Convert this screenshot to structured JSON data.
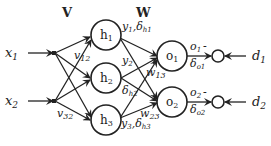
{
  "diagram": {
    "type": "neural-network-backprop",
    "layer_labels": {
      "input_to_hidden_weights": "V",
      "hidden_to_output_weights": "W"
    },
    "inputs": [
      {
        "id": "x1",
        "label": "x",
        "sub": "1"
      },
      {
        "id": "x2",
        "label": "x",
        "sub": "2"
      }
    ],
    "hidden_nodes": [
      {
        "id": "h1",
        "label": "h",
        "sub": "1"
      },
      {
        "id": "h2",
        "label": "h",
        "sub": "2"
      },
      {
        "id": "h3",
        "label": "h",
        "sub": "3"
      }
    ],
    "output_nodes": [
      {
        "id": "o1",
        "label": "o",
        "sub": "1"
      },
      {
        "id": "o2",
        "label": "o",
        "sub": "2"
      }
    ],
    "targets": [
      {
        "id": "d1",
        "label": "d",
        "sub": "1"
      },
      {
        "id": "d2",
        "label": "d",
        "sub": "2"
      }
    ],
    "edge_labels": {
      "v12": {
        "label": "v",
        "sub": "12"
      },
      "v32": {
        "label": "v",
        "sub": "32"
      },
      "w13": {
        "label": "w",
        "sub": "13"
      },
      "w23": {
        "label": "w",
        "sub": "23"
      }
    },
    "hidden_annotations": {
      "h1": {
        "y": "y",
        "ysub": "1",
        "delta": "δ",
        "dsub": "h1"
      },
      "h2": {
        "y": "y",
        "ysub": "2",
        "delta": "δ",
        "dsub": "h2"
      },
      "h3": {
        "y": "y",
        "ysub": "3",
        "delta": "δ",
        "dsub": "h3"
      }
    },
    "output_annotations": {
      "o1": {
        "o": "o",
        "osub": "1",
        "minus": "-",
        "delta": "δ",
        "dsub": "o1"
      },
      "o2": {
        "o": "o",
        "osub": "2",
        "minus": "-",
        "delta": "δ",
        "dsub": "o2"
      }
    },
    "separators": {
      "comma": ","
    }
  }
}
